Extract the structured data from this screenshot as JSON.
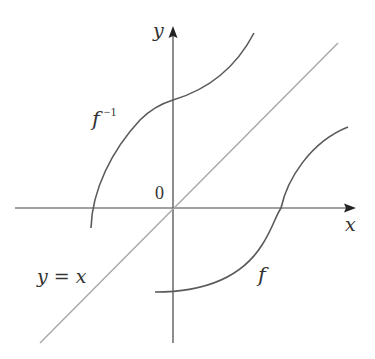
{
  "diagram": {
    "title": "",
    "axes": {
      "x_label": "x",
      "y_label": "y",
      "origin_label": "0"
    },
    "curves": [
      {
        "id": "f",
        "label": "f",
        "color": "#555555"
      },
      {
        "id": "f_inverse",
        "label": "f",
        "label_superscript": "−1",
        "color": "#555555"
      },
      {
        "id": "identity_line",
        "label": "y = x",
        "color": "#aaaaaa"
      }
    ]
  },
  "colors": {
    "axis": "#444444",
    "curve": "#5a5a5a",
    "identity_line": "#a8a8a8",
    "text": "#333333"
  }
}
